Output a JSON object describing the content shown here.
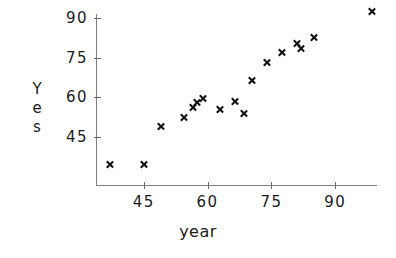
{
  "chart_data": {
    "type": "scatter",
    "title": "",
    "xlabel": "year",
    "ylabel": "Yes",
    "ylabel_letters": [
      "Y",
      "e",
      "s"
    ],
    "marker": "x",
    "marker_color": "#111111",
    "axis_color": "#808080",
    "grid": false,
    "legend": null,
    "xlim": [
      33,
      101
    ],
    "ylim": [
      31,
      95
    ],
    "xticks": [
      45,
      60,
      75,
      90
    ],
    "yticks": [
      45,
      60,
      75,
      90
    ],
    "xtick_labels": [
      "45",
      "60",
      "75",
      "90"
    ],
    "ytick_labels": [
      "45",
      "60",
      "75",
      "90"
    ],
    "x": [
      37,
      45,
      49,
      54.5,
      56.5,
      57.5,
      59,
      63,
      66.5,
      68.5,
      70.5,
      74,
      77.5,
      81,
      82,
      85,
      98.5
    ],
    "y": [
      34.5,
      34.5,
      49,
      52.5,
      56,
      58,
      59.5,
      55.5,
      58.5,
      54,
      66.5,
      73,
      77,
      80.5,
      78.5,
      82.5,
      92.5
    ],
    "points": [
      {
        "x": 37,
        "y": 34.5
      },
      {
        "x": 45,
        "y": 34.5
      },
      {
        "x": 49,
        "y": 49
      },
      {
        "x": 54.5,
        "y": 52.5
      },
      {
        "x": 56.5,
        "y": 56
      },
      {
        "x": 57.5,
        "y": 58
      },
      {
        "x": 59,
        "y": 59.5
      },
      {
        "x": 63,
        "y": 55.5
      },
      {
        "x": 66.5,
        "y": 58.5
      },
      {
        "x": 68.5,
        "y": 54
      },
      {
        "x": 70.5,
        "y": 66.5
      },
      {
        "x": 74,
        "y": 73
      },
      {
        "x": 77.5,
        "y": 77
      },
      {
        "x": 81,
        "y": 80.5
      },
      {
        "x": 82,
        "y": 78.5
      },
      {
        "x": 85,
        "y": 82.5
      },
      {
        "x": 98.5,
        "y": 92.5
      }
    ]
  }
}
